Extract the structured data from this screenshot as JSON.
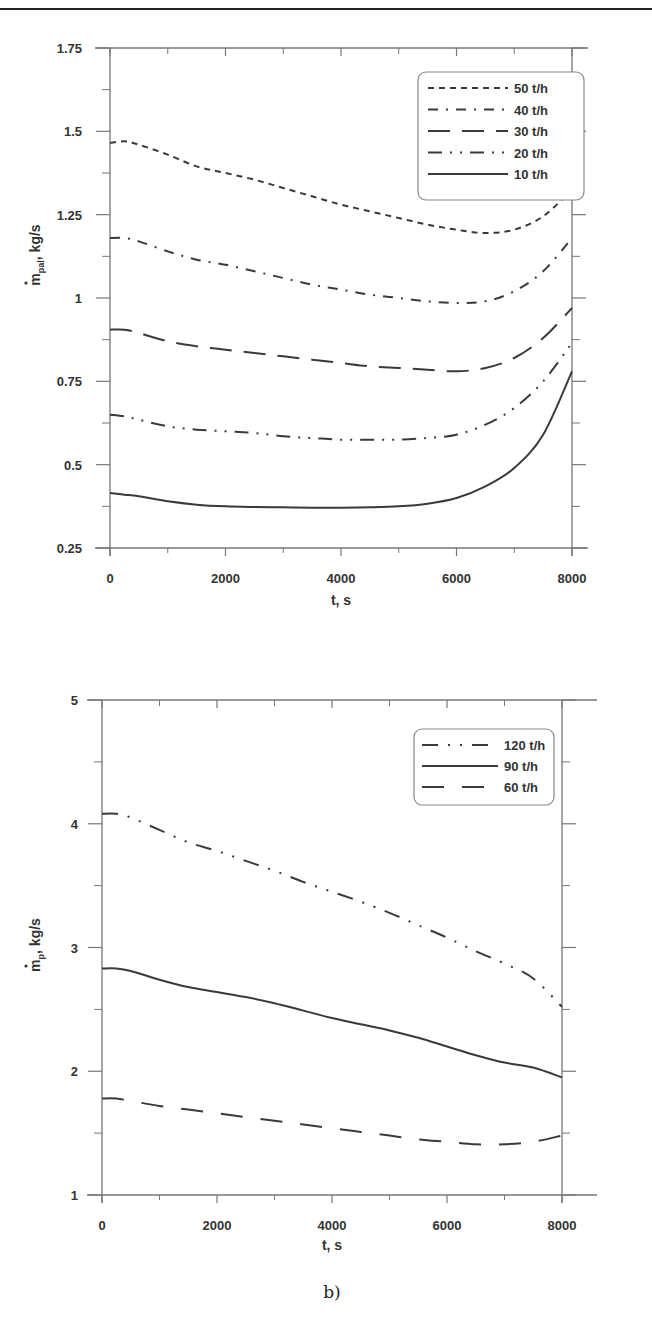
{
  "figure": {
    "caption_a": "a)",
    "caption_b": "b)"
  },
  "chart_data": [
    {
      "type": "line",
      "panel": "a)",
      "title": "",
      "xlabel": "t, s",
      "ylabel": "ṁ_pal, kg/s",
      "ylabel_main": "m",
      "ylabel_sub": "pal",
      "ylabel_unit": ", kg/s",
      "xlim": [
        0,
        8000
      ],
      "ylim": [
        0.25,
        1.75
      ],
      "xticks": [
        0,
        2000,
        4000,
        6000,
        8000
      ],
      "xtick_labels": [
        "0",
        "2000",
        "4000",
        "6000",
        "8000"
      ],
      "yticks": [
        0.25,
        0.5,
        0.75,
        1,
        1.25,
        1.5,
        1.75
      ],
      "ytick_labels": [
        "0.25",
        "0.5",
        "0.75",
        "1",
        "1.25",
        "1.5",
        "1.75"
      ],
      "grid": false,
      "legend_position": "upper right",
      "x": [
        0,
        250,
        500,
        1000,
        1500,
        2000,
        2500,
        3000,
        3500,
        4000,
        4500,
        5000,
        5500,
        6000,
        6500,
        7000,
        7500,
        8000
      ],
      "series": [
        {
          "name": "50 t/h",
          "dash": "6,5",
          "values": [
            1.465,
            1.47,
            1.46,
            1.43,
            1.395,
            1.375,
            1.355,
            1.33,
            1.305,
            1.28,
            1.26,
            1.24,
            1.22,
            1.205,
            1.195,
            1.205,
            1.245,
            1.325
          ]
        },
        {
          "name": "40 t/h",
          "dash": "10,8,2,8",
          "values": [
            1.18,
            1.18,
            1.17,
            1.14,
            1.115,
            1.1,
            1.08,
            1.06,
            1.04,
            1.025,
            1.01,
            1.0,
            0.99,
            0.985,
            0.99,
            1.02,
            1.08,
            1.18
          ]
        },
        {
          "name": "30 t/h",
          "dash": "22,12",
          "values": [
            0.905,
            0.905,
            0.895,
            0.87,
            0.855,
            0.845,
            0.835,
            0.825,
            0.815,
            0.805,
            0.795,
            0.79,
            0.785,
            0.78,
            0.79,
            0.82,
            0.88,
            0.97
          ]
        },
        {
          "name": "20 t/h",
          "dash": "14,8,2,8,2,8",
          "values": [
            0.65,
            0.645,
            0.635,
            0.615,
            0.605,
            0.6,
            0.595,
            0.585,
            0.58,
            0.575,
            0.575,
            0.575,
            0.58,
            0.59,
            0.62,
            0.67,
            0.75,
            0.865
          ]
        },
        {
          "name": "10 t/h",
          "dash": "",
          "values": [
            0.415,
            0.41,
            0.405,
            0.39,
            0.38,
            0.375,
            0.373,
            0.372,
            0.371,
            0.371,
            0.372,
            0.375,
            0.383,
            0.4,
            0.435,
            0.49,
            0.59,
            0.78
          ]
        }
      ]
    },
    {
      "type": "line",
      "panel": "b)",
      "title": "",
      "xlabel": "t, s",
      "ylabel": "ṁ_p, kg/s",
      "ylabel_main": "m",
      "ylabel_sub": "p",
      "ylabel_unit": ", kg/s",
      "xlim": [
        0,
        8000
      ],
      "ylim": [
        1,
        5
      ],
      "xticks": [
        0,
        2000,
        4000,
        6000,
        8000
      ],
      "xtick_labels": [
        "0",
        "2000",
        "4000",
        "6000",
        "8000"
      ],
      "yticks": [
        1,
        2,
        3,
        4,
        5
      ],
      "ytick_labels": [
        "1",
        "2",
        "3",
        "4",
        "5"
      ],
      "grid": false,
      "legend_position": "upper right",
      "x": [
        0,
        250,
        500,
        1000,
        1500,
        2000,
        2500,
        3000,
        3500,
        4000,
        4500,
        5000,
        5500,
        6000,
        6500,
        7000,
        7500,
        8000
      ],
      "series": [
        {
          "name": "120 t/h",
          "dash": "16,10,2,10,2,10",
          "values": [
            4.08,
            4.08,
            4.05,
            3.95,
            3.85,
            3.78,
            3.7,
            3.62,
            3.53,
            3.45,
            3.37,
            3.28,
            3.18,
            3.08,
            2.97,
            2.87,
            2.75,
            2.52
          ]
        },
        {
          "name": "90 t/h",
          "dash": "",
          "values": [
            2.83,
            2.83,
            2.81,
            2.74,
            2.68,
            2.64,
            2.6,
            2.55,
            2.49,
            2.43,
            2.38,
            2.33,
            2.27,
            2.2,
            2.13,
            2.07,
            2.03,
            1.95
          ]
        },
        {
          "name": "60 t/h",
          "dash": "22,18",
          "values": [
            1.78,
            1.78,
            1.76,
            1.72,
            1.69,
            1.66,
            1.63,
            1.6,
            1.57,
            1.54,
            1.51,
            1.48,
            1.45,
            1.43,
            1.41,
            1.41,
            1.43,
            1.48
          ]
        }
      ]
    }
  ]
}
